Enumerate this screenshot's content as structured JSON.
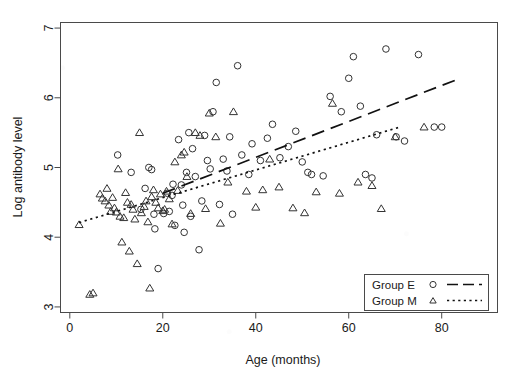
{
  "chart_data": {
    "type": "scatter",
    "title": "",
    "xlabel": "Age (months)",
    "ylabel": "Log antibody level",
    "xlim": [
      -2,
      92
    ],
    "ylim": [
      2.92,
      7.08
    ],
    "xticks": [
      0,
      20,
      40,
      60,
      80
    ],
    "yticks": [
      3,
      4,
      5,
      6,
      7
    ],
    "grid": false,
    "legend_position": "bottom-right",
    "legend": [
      {
        "name": "Group E",
        "marker": "circle",
        "line": "dashed"
      },
      {
        "name": "Group M",
        "marker": "triangle",
        "line": "dotted"
      }
    ],
    "series": [
      {
        "name": "Group E",
        "marker": "circle",
        "linestyle": "dashed",
        "color": "#333333",
        "points": [
          [
            10.3,
            5.18
          ],
          [
            13.2,
            4.93
          ],
          [
            15.3,
            4.4
          ],
          [
            16.2,
            4.7
          ],
          [
            17.0,
            5.0
          ],
          [
            17.6,
            4.97
          ],
          [
            18.1,
            4.33
          ],
          [
            18.3,
            4.12
          ],
          [
            19.0,
            3.55
          ],
          [
            20.2,
            4.34
          ],
          [
            21.0,
            4.63
          ],
          [
            21.4,
            4.37
          ],
          [
            22.0,
            4.6
          ],
          [
            22.2,
            4.76
          ],
          [
            22.6,
            4.17
          ],
          [
            23.4,
            5.4
          ],
          [
            24.0,
            4.75
          ],
          [
            24.3,
            4.46
          ],
          [
            24.6,
            4.07
          ],
          [
            25.1,
            4.93
          ],
          [
            25.6,
            5.5
          ],
          [
            26.0,
            4.3
          ],
          [
            26.4,
            5.27
          ],
          [
            27.0,
            4.87
          ],
          [
            27.8,
            3.82
          ],
          [
            28.4,
            4.52
          ],
          [
            29.0,
            5.46
          ],
          [
            29.6,
            5.1
          ],
          [
            30.2,
            4.98
          ],
          [
            30.8,
            5.8
          ],
          [
            31.5,
            6.22
          ],
          [
            32.2,
            4.47
          ],
          [
            33.0,
            5.12
          ],
          [
            33.8,
            4.95
          ],
          [
            34.4,
            5.44
          ],
          [
            35.0,
            4.33
          ],
          [
            36.1,
            6.46
          ],
          [
            37.0,
            5.18
          ],
          [
            38.5,
            4.9
          ],
          [
            39.2,
            5.34
          ],
          [
            41.0,
            5.1
          ],
          [
            42.5,
            5.42
          ],
          [
            43.6,
            5.62
          ],
          [
            45.2,
            5.14
          ],
          [
            47.0,
            5.3
          ],
          [
            48.6,
            5.52
          ],
          [
            50.0,
            5.08
          ],
          [
            51.2,
            4.93
          ],
          [
            52.0,
            4.9
          ],
          [
            54.5,
            4.88
          ],
          [
            56.0,
            6.02
          ],
          [
            58.4,
            5.8
          ],
          [
            60.0,
            6.28
          ],
          [
            61.0,
            6.59
          ],
          [
            62.5,
            5.88
          ],
          [
            63.6,
            4.9
          ],
          [
            65.0,
            4.85
          ],
          [
            66.0,
            5.47
          ],
          [
            68.0,
            6.7
          ],
          [
            70.2,
            5.44
          ],
          [
            72.0,
            5.38
          ],
          [
            75.0,
            6.62
          ],
          [
            78.4,
            5.58
          ],
          [
            80.0,
            5.58
          ]
        ]
      },
      {
        "name": "Group M",
        "marker": "triangle",
        "linestyle": "dotted",
        "color": "#333333",
        "points": [
          [
            2.0,
            4.18
          ],
          [
            4.3,
            3.18
          ],
          [
            5.0,
            3.2
          ],
          [
            6.5,
            4.62
          ],
          [
            7.0,
            4.56
          ],
          [
            7.6,
            4.52
          ],
          [
            8.0,
            4.7
          ],
          [
            8.4,
            4.46
          ],
          [
            8.8,
            4.37
          ],
          [
            9.2,
            4.57
          ],
          [
            9.6,
            4.42
          ],
          [
            10.0,
            4.36
          ],
          [
            10.4,
            4.98
          ],
          [
            10.8,
            4.3
          ],
          [
            11.2,
            3.93
          ],
          [
            11.6,
            4.28
          ],
          [
            12.0,
            4.64
          ],
          [
            12.4,
            4.5
          ],
          [
            12.8,
            3.8
          ],
          [
            13.2,
            4.47
          ],
          [
            13.6,
            4.4
          ],
          [
            14.0,
            4.26
          ],
          [
            14.5,
            3.62
          ],
          [
            15.0,
            5.5
          ],
          [
            15.4,
            4.35
          ],
          [
            16.0,
            4.44
          ],
          [
            16.4,
            4.52
          ],
          [
            16.8,
            4.22
          ],
          [
            17.2,
            3.27
          ],
          [
            17.6,
            4.58
          ],
          [
            18.0,
            4.68
          ],
          [
            18.5,
            4.5
          ],
          [
            19.0,
            4.42
          ],
          [
            19.5,
            4.62
          ],
          [
            20.0,
            4.38
          ],
          [
            20.4,
            4.4
          ],
          [
            20.8,
            4.66
          ],
          [
            21.4,
            4.55
          ],
          [
            22.0,
            4.19
          ],
          [
            22.6,
            5.08
          ],
          [
            23.2,
            4.67
          ],
          [
            24.0,
            5.18
          ],
          [
            24.6,
            5.22
          ],
          [
            25.2,
            4.87
          ],
          [
            26.0,
            4.34
          ],
          [
            27.0,
            5.5
          ],
          [
            28.0,
            5.46
          ],
          [
            29.2,
            4.41
          ],
          [
            30.0,
            5.78
          ],
          [
            31.4,
            5.44
          ],
          [
            32.4,
            4.2
          ],
          [
            34.0,
            4.79
          ],
          [
            35.2,
            5.8
          ],
          [
            38.0,
            4.66
          ],
          [
            40.0,
            4.43
          ],
          [
            41.5,
            4.68
          ],
          [
            43.0,
            5.12
          ],
          [
            45.0,
            4.72
          ],
          [
            48.0,
            4.42
          ],
          [
            50.5,
            4.35
          ],
          [
            53.0,
            4.65
          ],
          [
            56.5,
            5.92
          ],
          [
            58.0,
            4.63
          ],
          [
            62.0,
            4.79
          ],
          [
            65.0,
            4.74
          ],
          [
            67.0,
            4.41
          ],
          [
            70.0,
            5.44
          ],
          [
            76.2,
            5.58
          ]
        ]
      }
    ],
    "trend_lines": [
      {
        "name": "Group E",
        "style": "dashed",
        "x0": 20.0,
        "y0": 4.63,
        "x1": 84.0,
        "y1": 6.28
      },
      {
        "name": "Group M",
        "style": "dotted",
        "x0": 2.0,
        "y0": 4.21,
        "x1": 71.0,
        "y1": 5.58
      }
    ]
  }
}
